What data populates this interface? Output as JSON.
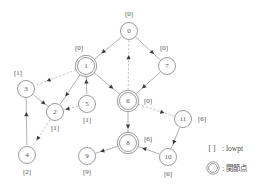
{
  "diagram": {
    "colors": {
      "node_stroke": "#808080",
      "tree_edge": "#909090",
      "back_edge": "#a8a8a8",
      "arrow": "#3a3a3a",
      "text": "#555555",
      "background": "#ffffff"
    },
    "nodes": [
      {
        "id": "0",
        "label": "0",
        "lowpt": "[0]",
        "cx": 129,
        "cy": 31,
        "r": 8.5,
        "articulation": false,
        "lowpt_x": 129,
        "lowpt_y": 14,
        "lowpt_anchor": "middle"
      },
      {
        "id": "1",
        "label": "1",
        "lowpt": "[0]",
        "cx": 86,
        "cy": 66,
        "r": 8.5,
        "articulation": true,
        "lowpt_x": 79,
        "lowpt_y": 48,
        "lowpt_anchor": "middle"
      },
      {
        "id": "2",
        "label": "2",
        "lowpt": "[1]",
        "cx": 55,
        "cy": 112,
        "r": 8.5,
        "articulation": false,
        "lowpt_x": 55,
        "lowpt_y": 128,
        "lowpt_anchor": "middle"
      },
      {
        "id": "3",
        "label": "3",
        "lowpt": "[1]",
        "cx": 26,
        "cy": 89,
        "r": 8.5,
        "articulation": false,
        "lowpt_x": 18,
        "lowpt_y": 73,
        "lowpt_anchor": "middle"
      },
      {
        "id": "4",
        "label": "4",
        "lowpt": "[2]",
        "cx": 27,
        "cy": 155,
        "r": 8.5,
        "articulation": false,
        "lowpt_x": 27,
        "lowpt_y": 172,
        "lowpt_anchor": "middle"
      },
      {
        "id": "5",
        "label": "5",
        "lowpt": "[1]",
        "cx": 87,
        "cy": 104,
        "r": 8.5,
        "articulation": false,
        "lowpt_x": 87,
        "lowpt_y": 120,
        "lowpt_anchor": "middle"
      },
      {
        "id": "6",
        "label": "6",
        "lowpt": "[0]",
        "cx": 128,
        "cy": 101,
        "r": 8.5,
        "articulation": true,
        "lowpt_x": 148,
        "lowpt_y": 101,
        "lowpt_anchor": "middle"
      },
      {
        "id": "7",
        "label": "7",
        "lowpt": "[0]",
        "cx": 167,
        "cy": 66,
        "r": 8.5,
        "articulation": false,
        "lowpt_x": 164,
        "lowpt_y": 48,
        "lowpt_anchor": "middle"
      },
      {
        "id": "8",
        "label": "8",
        "lowpt": "[6]",
        "cx": 128,
        "cy": 143,
        "r": 8.5,
        "articulation": true,
        "lowpt_x": 148,
        "lowpt_y": 139,
        "lowpt_anchor": "middle"
      },
      {
        "id": "9",
        "label": "9",
        "lowpt": "[9]",
        "cx": 87,
        "cy": 156,
        "r": 8.5,
        "articulation": false,
        "lowpt_x": 87,
        "lowpt_y": 172,
        "lowpt_anchor": "middle"
      },
      {
        "id": "10",
        "label": "10",
        "lowpt": "[6]",
        "cx": 168,
        "cy": 157,
        "r": 8.5,
        "articulation": false,
        "lowpt_x": 168,
        "lowpt_y": 174,
        "lowpt_anchor": "middle"
      },
      {
        "id": "11",
        "label": "11",
        "lowpt": "[6]",
        "cx": 183,
        "cy": 119,
        "r": 8.5,
        "articulation": false,
        "lowpt_x": 202,
        "lowpt_y": 119,
        "lowpt_anchor": "middle"
      }
    ],
    "edges": [
      {
        "from": "0",
        "to": "1",
        "type": "tree",
        "arrow": "to"
      },
      {
        "from": "0",
        "to": "7",
        "type": "tree",
        "arrow": "to"
      },
      {
        "from": "1",
        "to": "2",
        "type": "tree",
        "arrow": "to"
      },
      {
        "from": "1",
        "to": "3",
        "type": "back",
        "arrow": "to"
      },
      {
        "from": "1",
        "to": "6",
        "type": "tree",
        "arrow": "to"
      },
      {
        "from": "3",
        "to": "2",
        "type": "tree",
        "arrow": "to"
      },
      {
        "from": "2",
        "to": "4",
        "type": "back",
        "arrow": "to"
      },
      {
        "from": "4",
        "to": "3",
        "type": "tree",
        "arrow": "to"
      },
      {
        "from": "5",
        "to": "1",
        "type": "tree",
        "arrow": "to"
      },
      {
        "from": "5",
        "to": "2",
        "type": "back",
        "arrow": "to"
      },
      {
        "from": "6",
        "to": "0",
        "type": "back",
        "arrow": "to"
      },
      {
        "from": "7",
        "to": "6",
        "type": "tree",
        "arrow": "to"
      },
      {
        "from": "6",
        "to": "8",
        "type": "tree",
        "arrow": "to"
      },
      {
        "from": "6",
        "to": "11",
        "type": "back",
        "arrow": "to"
      },
      {
        "from": "11",
        "to": "10",
        "type": "tree",
        "arrow": "to"
      },
      {
        "from": "10",
        "to": "8",
        "type": "tree",
        "arrow": "to"
      },
      {
        "from": "8",
        "to": "9",
        "type": "tree",
        "arrow": "to"
      }
    ]
  },
  "legend": {
    "items": [
      {
        "symbol": "[  ]",
        "separator": ":",
        "text": "lowpt",
        "icon": "bracket"
      },
      {
        "symbol": "",
        "separator": ":",
        "text": "関節点",
        "icon": "double-circle"
      }
    ],
    "bracket_x": 212,
    "bracket_y": 148,
    "circle_cx": 213,
    "circle_cy": 168,
    "label_x": 226,
    "sep_x": 222
  }
}
